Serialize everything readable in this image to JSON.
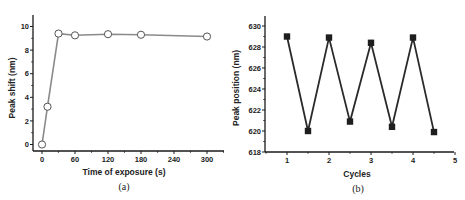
{
  "chart_data": [
    {
      "id": "a",
      "type": "line",
      "caption": "(a)",
      "title": "",
      "xlabel": "Time of exposure (s)",
      "ylabel": "Peak shift (nm)",
      "xlim": [
        -15,
        335
      ],
      "ylim": [
        -0.5,
        11
      ],
      "xticks": [
        0,
        60,
        120,
        180,
        240,
        300
      ],
      "yticks": [
        0,
        2,
        4,
        6,
        8,
        10
      ],
      "grid": false,
      "legend": null,
      "series": [
        {
          "name": "Peak shift",
          "marker": "open-circle",
          "line_color": "#8a8a8a",
          "x": [
            0,
            10,
            30,
            60,
            120,
            180,
            300
          ],
          "y": [
            0,
            3.2,
            9.4,
            9.25,
            9.35,
            9.3,
            9.15
          ]
        }
      ]
    },
    {
      "id": "b",
      "type": "line",
      "caption": "(b)",
      "title": "",
      "xlabel": "Cycles",
      "ylabel": "Peak position (nm)",
      "xlim": [
        0.5,
        5
      ],
      "ylim": [
        618,
        631
      ],
      "xticks": [
        1,
        2,
        3,
        4,
        5
      ],
      "yticks": [
        618,
        620,
        622,
        624,
        626,
        628,
        630
      ],
      "grid": false,
      "legend": null,
      "series": [
        {
          "name": "Peak position",
          "marker": "filled-square",
          "line_color": "#2a2a2a",
          "x": [
            1,
            1.5,
            2,
            2.5,
            3,
            3.5,
            4,
            4.5
          ],
          "y": [
            629.0,
            620.0,
            628.9,
            620.9,
            628.4,
            620.4,
            628.9,
            619.9
          ]
        }
      ]
    }
  ],
  "panels": {
    "a": {
      "caption": "(a)",
      "xlabel": "Time of exposure (s)",
      "ylabel": "Peak shift (nm)",
      "xtick_labels": [
        "0",
        "60",
        "120",
        "180",
        "240",
        "300"
      ],
      "ytick_labels": [
        "0",
        "2",
        "4",
        "6",
        "8",
        "10"
      ]
    },
    "b": {
      "caption": "(b)",
      "xlabel": "Cycles",
      "ylabel": "Peak position (nm)",
      "xtick_labels": [
        "1",
        "2",
        "3",
        "4",
        "5"
      ],
      "ytick_labels": [
        "618",
        "620",
        "622",
        "624",
        "626",
        "628",
        "630"
      ]
    }
  }
}
